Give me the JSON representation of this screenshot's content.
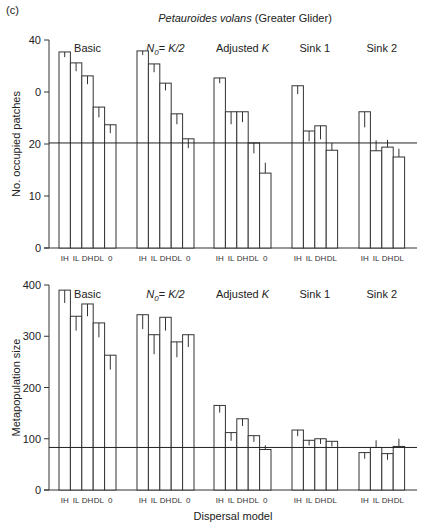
{
  "figure": {
    "panel_label": "(c)",
    "title_italic": "Petauroides volans",
    "title_rest": " (Greater Glider)",
    "xlabel": "Dispersal model"
  },
  "chart_data": [
    {
      "type": "bar",
      "title": "Petauroides volans (Greater Glider)",
      "ylabel": "No. occupied patches",
      "xlabel": "",
      "ylim": [
        0,
        40
      ],
      "yticks": [
        0,
        10,
        20,
        30,
        40
      ],
      "ytick_labels": [
        "0",
        "10",
        "20",
        "0",
        "40"
      ],
      "reference_line": 20.2,
      "grid": false,
      "groups": [
        {
          "name": "Basic",
          "categories": [
            "IH",
            "IL",
            "DH",
            "DL",
            "0"
          ],
          "values": [
            37.7,
            35.6,
            33.1,
            27.1,
            23.7
          ],
          "err_up": [
            0,
            0,
            0,
            0,
            0
          ],
          "err_down": [
            1.0,
            1.6,
            1.6,
            2.0,
            1.6
          ]
        },
        {
          "name": "N0 = K/2",
          "categories": [
            "IH",
            "IL",
            "DH",
            "DL",
            "0"
          ],
          "values": [
            37.9,
            35.4,
            31.7,
            25.8,
            21.0
          ],
          "err_up": [
            0,
            0,
            0,
            0,
            0
          ],
          "err_down": [
            0.8,
            1.6,
            1.4,
            2.0,
            1.8
          ]
        },
        {
          "name": "Adjusted K",
          "categories": [
            "IH",
            "IL",
            "DH",
            "DL",
            "0"
          ],
          "values": [
            32.7,
            26.2,
            26.2,
            20.2,
            14.4
          ],
          "err_up": [
            0,
            0,
            0,
            0,
            2.0
          ],
          "err_down": [
            1.0,
            2.4,
            2.0,
            2.0,
            0
          ]
        },
        {
          "name": "Sink 1",
          "categories": [
            "IH",
            "IL",
            "DH",
            "DL"
          ],
          "values": [
            31.2,
            22.5,
            23.5,
            18.8
          ],
          "err_up": [
            0,
            0,
            0,
            1.4
          ],
          "err_down": [
            1.6,
            2.0,
            2.6,
            0
          ]
        },
        {
          "name": "Sink 2",
          "categories": [
            "IH",
            "IL",
            "DH",
            "DL"
          ],
          "values": [
            26.2,
            18.7,
            19.4,
            17.5
          ],
          "err_up": [
            0,
            2.0,
            1.4,
            1.6
          ],
          "err_down": [
            3.0,
            0,
            0,
            0
          ]
        }
      ]
    },
    {
      "type": "bar",
      "title": "",
      "ylabel": "Metapopulation size",
      "xlabel": "Dispersal model",
      "ylim": [
        0,
        400
      ],
      "yticks": [
        0,
        100,
        200,
        300,
        400
      ],
      "ytick_labels": [
        "0",
        "100",
        "200",
        "300",
        "400"
      ],
      "reference_line": 83,
      "grid": false,
      "groups": [
        {
          "name": "Basic",
          "categories": [
            "IH",
            "IL",
            "DH",
            "DL",
            "0"
          ],
          "values": [
            390,
            339,
            363,
            326,
            263
          ],
          "err_up": [
            0,
            0,
            0,
            0,
            0
          ],
          "err_down": [
            25,
            28,
            24,
            28,
            28
          ]
        },
        {
          "name": "N0 = K/2",
          "categories": [
            "IH",
            "IL",
            "DH",
            "DL",
            "0"
          ],
          "values": [
            342,
            303,
            337,
            289,
            303
          ],
          "err_up": [
            0,
            0,
            0,
            0,
            0
          ],
          "err_down": [
            28,
            38,
            26,
            30,
            24
          ]
        },
        {
          "name": "Adjusted K",
          "categories": [
            "IH",
            "IL",
            "DH",
            "DL",
            "0"
          ],
          "values": [
            165,
            112,
            139,
            106,
            79
          ],
          "err_up": [
            0,
            0,
            0,
            0,
            8
          ],
          "err_down": [
            14,
            16,
            14,
            12,
            0
          ]
        },
        {
          "name": "Sink 1",
          "categories": [
            "IH",
            "IL",
            "DH",
            "DL"
          ],
          "values": [
            117,
            97,
            100,
            95
          ],
          "err_up": [
            0,
            0,
            0,
            0
          ],
          "err_down": [
            12,
            10,
            10,
            10
          ]
        },
        {
          "name": "Sink 2",
          "categories": [
            "IH",
            "IL",
            "DH",
            "DL"
          ],
          "values": [
            73,
            83,
            71,
            85
          ],
          "err_up": [
            0,
            14,
            0,
            15
          ],
          "err_down": [
            12,
            0,
            12,
            0
          ]
        }
      ]
    }
  ],
  "layout": {
    "panels": [
      {
        "plot_top": 40,
        "plot_bottom": 248,
        "axis_x": 49,
        "axis_end": 417
      },
      {
        "plot_top": 285,
        "plot_bottom": 490,
        "axis_x": 49,
        "axis_end": 417
      }
    ],
    "group_starts": [
      59,
      137,
      214,
      292,
      359
    ],
    "bar_width": 11.4,
    "panel_title_y": [
      52,
      298
    ]
  }
}
